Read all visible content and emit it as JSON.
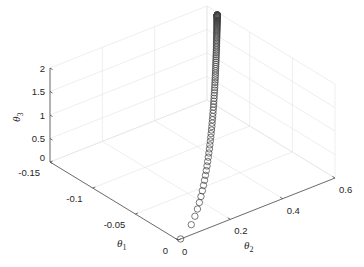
{
  "chart_data": {
    "type": "scatter3d",
    "title": "",
    "xlabel": "θ1",
    "ylabel": "θ2",
    "zlabel": "θ3",
    "xlim": [
      -0.15,
      0
    ],
    "ylim": [
      0,
      0.6
    ],
    "zlim": [
      0,
      2
    ],
    "x_ticks": [
      "-0.15",
      "-0.1",
      "-0.05",
      "0"
    ],
    "y_ticks": [
      "0",
      "0.2",
      "0.4",
      "0.6"
    ],
    "z_ticks": [
      "0",
      "0.5",
      "1",
      "1.5",
      "2"
    ],
    "grid": true,
    "marker": "open-circle",
    "marker_color": "#404040",
    "series": [
      {
        "name": "trajectory",
        "points_description": "Curve of ~100 open circle markers starting near (θ1≈0, θ2≈0, θ3≈0) rising to (θ1≈-0.135, θ2≈0.59, θ3≈2); markers dense near top",
        "start": [
          0,
          0.01,
          0
        ],
        "end": [
          -0.135,
          0.59,
          2.0
        ]
      }
    ]
  },
  "axes": {
    "x_label": "θ",
    "x_label_sub": "1",
    "y_label": "θ",
    "y_label_sub": "2",
    "z_label": "θ",
    "z_label_sub": "3"
  }
}
